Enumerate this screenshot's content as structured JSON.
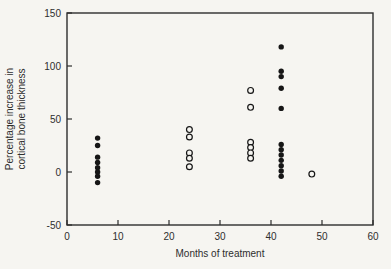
{
  "figure": {
    "background": "#f6f5f1",
    "frame_color": "#2e2e2e",
    "text_color": "#2e2e2e",
    "marker_color": "#161616",
    "open_marker_fill": "#f6f5f1"
  },
  "chart_data": {
    "type": "scatter",
    "title": "",
    "xlabel": "Months of treatment",
    "ylabel_lines": [
      "Percentage increase in",
      "cortical bone thickness"
    ],
    "xlim": [
      0,
      60
    ],
    "ylim": [
      -50,
      150
    ],
    "x_ticks": [
      0,
      10,
      20,
      30,
      40,
      50,
      60
    ],
    "y_ticks": [
      -50,
      0,
      50,
      100,
      150
    ],
    "grid": false,
    "legend": "none",
    "series": [
      {
        "name": "filled-circles",
        "marker": "filled",
        "points": [
          [
            6,
            32
          ],
          [
            6,
            25
          ],
          [
            6,
            14
          ],
          [
            6,
            9
          ],
          [
            6,
            4
          ],
          [
            6,
            0
          ],
          [
            6,
            -4
          ],
          [
            6,
            -10
          ],
          [
            42,
            118
          ],
          [
            42,
            95
          ],
          [
            42,
            90
          ],
          [
            42,
            79
          ],
          [
            42,
            60
          ],
          [
            42,
            26
          ],
          [
            42,
            21
          ],
          [
            42,
            16
          ],
          [
            42,
            11
          ],
          [
            42,
            6
          ],
          [
            42,
            1
          ],
          [
            42,
            -4
          ]
        ]
      },
      {
        "name": "open-circles",
        "marker": "open",
        "points": [
          [
            24,
            40
          ],
          [
            24,
            33
          ],
          [
            24,
            18
          ],
          [
            24,
            13
          ],
          [
            24,
            5
          ],
          [
            36,
            77
          ],
          [
            36,
            61
          ],
          [
            36,
            28
          ],
          [
            36,
            23
          ],
          [
            36,
            18
          ],
          [
            36,
            13
          ],
          [
            48,
            -2
          ]
        ]
      }
    ]
  }
}
